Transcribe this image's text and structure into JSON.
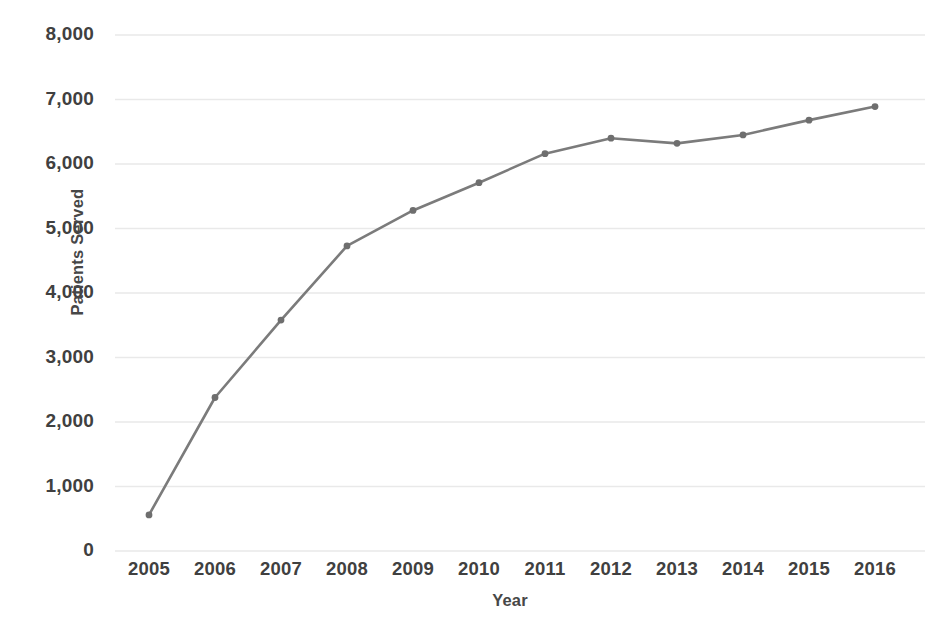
{
  "chart_data": {
    "type": "line",
    "title": "",
    "xlabel": "Year",
    "ylabel": "Patients Served",
    "categories": [
      "2005",
      "2006",
      "2007",
      "2008",
      "2009",
      "2010",
      "2011",
      "2012",
      "2013",
      "2014",
      "2015",
      "2016"
    ],
    "values": [
      560,
      2380,
      3580,
      4730,
      5280,
      5710,
      6160,
      6400,
      6320,
      6450,
      6680,
      6890
    ],
    "series": [
      {
        "name": "Patients Served",
        "values": [
          560,
          2380,
          3580,
          4730,
          5280,
          5710,
          6160,
          6400,
          6320,
          6450,
          6680,
          6890
        ]
      }
    ],
    "ylim": [
      0,
      8000
    ],
    "ytick_labels": [
      "8,000",
      "7,000",
      "6,000",
      "5,000",
      "4,000",
      "3,000",
      "2,000",
      "1,000",
      "0"
    ],
    "ytick_values": [
      8000,
      7000,
      6000,
      5000,
      4000,
      3000,
      2000,
      1000,
      0
    ],
    "grid": true,
    "grid_axis": "y",
    "legend": false,
    "legend_position": "none",
    "markers": true,
    "colors": {
      "line": "#7b7b7b",
      "marker": "#6e6e6e",
      "grid": "#e9e9e9",
      "tick_label": "#404040",
      "axis_title": "#474747",
      "background": "#ffffff"
    }
  }
}
